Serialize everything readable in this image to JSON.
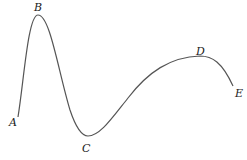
{
  "diagram": {
    "type": "curve-with-labeled-points",
    "stroke_color": "#555555",
    "label_color": "#1a1a1a",
    "points": [
      {
        "id": "A",
        "label": "A",
        "x": 18,
        "y": 117,
        "label_x": 9,
        "label_y": 126
      },
      {
        "id": "B",
        "label": "B",
        "x": 38,
        "y": 15,
        "label_x": 34,
        "label_y": 11
      },
      {
        "id": "C",
        "label": "C",
        "x": 88,
        "y": 136,
        "label_x": 82,
        "label_y": 152
      },
      {
        "id": "D",
        "label": "D",
        "x": 212,
        "y": 57,
        "label_x": 196,
        "label_y": 55
      },
      {
        "id": "E",
        "label": "E",
        "x": 233,
        "y": 86,
        "label_x": 235,
        "label_y": 97
      }
    ]
  }
}
